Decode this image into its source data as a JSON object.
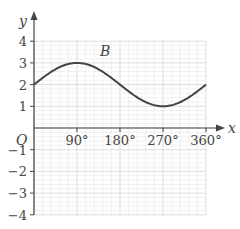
{
  "chart_data": {
    "type": "line",
    "title": "",
    "xlabel": "x",
    "ylabel": "y",
    "origin_label": "O",
    "curve_label": "B",
    "function": "y = 2 + sin x",
    "xlim": [
      0,
      360
    ],
    "ylim": [
      -4,
      4
    ],
    "x_ticks": [
      90,
      180,
      270,
      360
    ],
    "x_tick_labels": [
      "90°",
      "180°",
      "270°",
      "360°"
    ],
    "y_ticks": [
      4,
      3,
      2,
      1,
      -1,
      -2,
      -3,
      -4
    ],
    "y_tick_labels": [
      "4",
      "3",
      "2",
      "1",
      "−1",
      "−2",
      "−3",
      "−4"
    ],
    "grid": true,
    "series": [
      {
        "name": "B",
        "x": [
          0,
          30,
          60,
          90,
          120,
          150,
          180,
          210,
          240,
          270,
          300,
          330,
          360
        ],
        "values": [
          2,
          2.5,
          2.87,
          3,
          2.87,
          2.5,
          2,
          1.5,
          1.13,
          1,
          1.13,
          1.5,
          2
        ]
      }
    ],
    "colors": {
      "curve": "#444444",
      "axis": "#444444",
      "grid_major": "#c8c8c8",
      "grid_minor": "#e6e6e6"
    }
  }
}
